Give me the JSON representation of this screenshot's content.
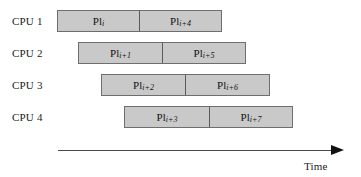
{
  "figure": {
    "background_color": "#ffffff",
    "bar_fill_color": "#c9c9c9",
    "bar_border_color": "#6e6e6e",
    "text_color": "#111111"
  },
  "rows": [
    {
      "cpu_label": "CPU 1",
      "label_x": 12,
      "label_y": 15,
      "bar_x": 57,
      "bar_y": 10,
      "bar_width": 165,
      "split_width": 82,
      "segments": [
        {
          "base": "Pl",
          "sub": "i"
        },
        {
          "base": "Pl",
          "sub": "i+4"
        }
      ]
    },
    {
      "cpu_label": "CPU 2",
      "label_x": 12,
      "label_y": 47,
      "bar_x": 78,
      "bar_y": 42,
      "bar_width": 168,
      "split_width": 84,
      "segments": [
        {
          "base": "Pl",
          "sub": "i+1"
        },
        {
          "base": "Pl",
          "sub": "i+5"
        }
      ]
    },
    {
      "cpu_label": "CPU 3",
      "label_x": 12,
      "label_y": 79,
      "bar_x": 101,
      "bar_y": 74,
      "bar_width": 169,
      "split_width": 84,
      "segments": [
        {
          "base": "Pl",
          "sub": "i+2"
        },
        {
          "base": "Pl",
          "sub": "i+6"
        }
      ]
    },
    {
      "cpu_label": "CPU 4",
      "label_x": 12,
      "label_y": 111,
      "bar_x": 124,
      "bar_y": 106,
      "bar_width": 169,
      "split_width": 85,
      "segments": [
        {
          "base": "Pl",
          "sub": "i+3"
        },
        {
          "base": "Pl",
          "sub": "i+7"
        }
      ]
    }
  ],
  "axis": {
    "label": "Time",
    "label_x": 304,
    "label_y": 160,
    "line_x": 58,
    "line_y": 150,
    "line_width": 273,
    "arrow_x": 331,
    "arrow_y": 145
  },
  "chart_data": {
    "type": "bar",
    "title": "",
    "xlabel": "Time",
    "ylabel": "",
    "categories": [
      "CPU 1",
      "CPU 2",
      "CPU 3",
      "CPU 4"
    ],
    "series": [
      {
        "name": "first-task",
        "values": [
          "Pl i",
          "Pl i+1",
          "Pl i+2",
          "Pl i+3"
        ]
      },
      {
        "name": "second-task",
        "values": [
          "Pl i+4",
          "Pl i+5",
          "Pl i+6",
          "Pl i+7"
        ]
      }
    ],
    "bar_starts": [
      57,
      78,
      101,
      124
    ],
    "bar_ends": [
      222,
      246,
      270,
      293
    ],
    "bar_splits": [
      139,
      162,
      185,
      209
    ],
    "grid": false,
    "legend": "none"
  }
}
